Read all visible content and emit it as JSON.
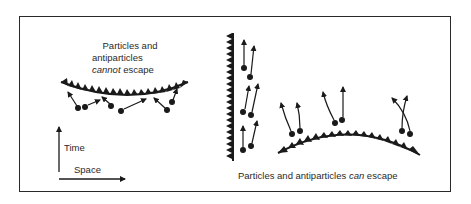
{
  "diagram": {
    "left_panel": {
      "caption_line1": "Particles and",
      "caption_line2": "antiparticles",
      "caption_line3_em": "cannot",
      "caption_line3_rest": " escape"
    },
    "axes": {
      "time_label": "Time",
      "space_label": "Space"
    },
    "right_panel": {
      "caption_pre": "Particles and antiparticles ",
      "caption_em": "can",
      "caption_post": " escape"
    },
    "colors": {
      "ink": "#1a1a1a",
      "frame": "#2a2a2a",
      "background": "#ffffff"
    }
  }
}
